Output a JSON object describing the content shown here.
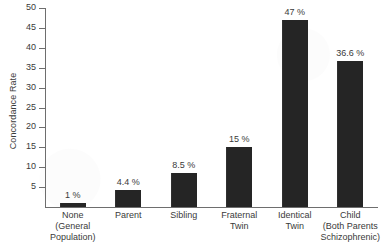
{
  "chart_data": {
    "type": "bar",
    "title": "",
    "xlabel": "",
    "ylabel": "Concordance Rate",
    "ylim": [
      0,
      50
    ],
    "grid": false,
    "legend": "none",
    "y_ticks": [
      0,
      5,
      10,
      15,
      20,
      25,
      30,
      35,
      40,
      45,
      50
    ],
    "y_tick_labels": [
      "",
      "5",
      "10",
      "15",
      "20",
      "25",
      "30",
      "35",
      "40",
      "45",
      "50"
    ],
    "categories": [
      "None (General Population)",
      "Parent",
      "Sibling",
      "Fraternal Twin",
      "Identical Twin",
      "Child (Both Parents Schizophrenic)"
    ],
    "category_lines": [
      [
        "None",
        "(General",
        "Population)"
      ],
      [
        "Parent"
      ],
      [
        "Sibling"
      ],
      [
        "Fraternal",
        "Twin"
      ],
      [
        "Identical",
        "Twin"
      ],
      [
        "Child",
        "(Both Parents",
        "Schizophrenic)"
      ]
    ],
    "values": [
      1,
      4.4,
      8.5,
      15,
      47,
      36.6
    ],
    "value_labels": [
      "1 %",
      "4.4 %",
      "8.5 %",
      "15 %",
      "47 %",
      "36.6 %"
    ],
    "colors": {
      "bar": "#252525",
      "axis": "#6e6e6e",
      "text": "#3a3a3a",
      "background": "#ffffff"
    }
  }
}
